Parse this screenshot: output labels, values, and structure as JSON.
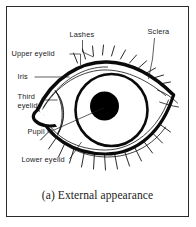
{
  "figure": {
    "caption": "(a) External appearance",
    "caption_prefix": "(a)",
    "border_color": "#2b2b2b",
    "ink_color": "#0a0a0a",
    "background_color": "#ffffff"
  },
  "labels": [
    {
      "id": "lashes",
      "text": "Lashes",
      "x": 62,
      "y": 30
    },
    {
      "id": "sclera",
      "text": "Sclera",
      "x": 140,
      "y": 27
    },
    {
      "id": "upper-eyelid",
      "text": "Upper eyelid",
      "x": 9,
      "y": 49
    },
    {
      "id": "iris",
      "text": "Iris",
      "x": 12,
      "y": 72
    },
    {
      "id": "third-eyelid",
      "text": "Third",
      "x": 12,
      "y": 92
    },
    {
      "id": "third-eyelid2",
      "text": "eyelid",
      "x": 12,
      "y": 101
    },
    {
      "id": "pupil",
      "text": "Pupil",
      "x": 22,
      "y": 127
    },
    {
      "id": "lower-eyelid",
      "text": "Lower eyelid",
      "x": 16,
      "y": 155
    }
  ],
  "parts": {
    "pupil_fill": "#000000",
    "iris_fill": "#ffffff",
    "sclera_fill": "#ffffff"
  }
}
